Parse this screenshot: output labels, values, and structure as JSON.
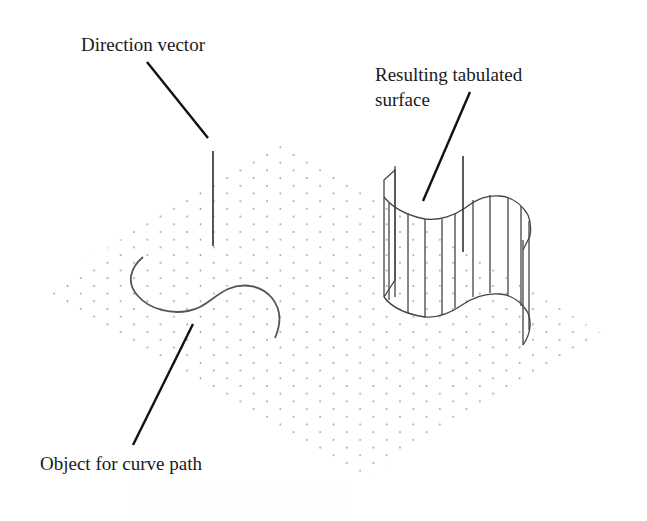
{
  "diagram": {
    "labels": {
      "direction_vector": "Direction vector",
      "resulting_surface_line1": "Resulting tabulated",
      "resulting_surface_line2": "surface",
      "object_for_curve_path": "Object for curve path"
    },
    "colors": {
      "background": "#ffffff",
      "text": "#1a1a1a",
      "leader_line": "#111111",
      "geometry": "#444444",
      "grid_dot": "#9a9a9a"
    },
    "grid": {
      "style": "isometric dot grid",
      "corners": {
        "top": [
          281,
          141
        ],
        "right": [
          604,
          337
        ],
        "bottom": [
          361,
          481
        ],
        "left": [
          42,
          291
        ]
      }
    },
    "objects": [
      {
        "name": "direction-vector",
        "type": "line",
        "from": [
          212,
          150
        ],
        "to": [
          212,
          245
        ]
      },
      {
        "name": "curve-path",
        "type": "s-curve",
        "start": [
          143,
          258
        ],
        "end": [
          275,
          338
        ]
      },
      {
        "name": "tabulated-surface",
        "type": "ruled surface",
        "ruling_count": 13
      }
    ]
  }
}
